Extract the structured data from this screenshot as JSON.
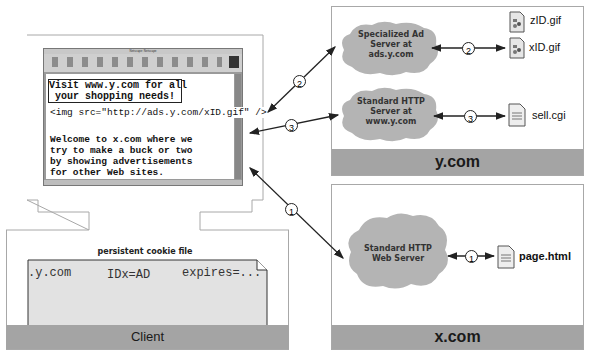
{
  "client": {
    "label": "Client",
    "browser": {
      "title": "Netscape: Netscape",
      "toolbar_buttons": [
        "Back",
        "Forward",
        "Reload",
        "Home",
        "Search",
        "Netscape",
        "Images",
        "Print",
        "Security",
        "Stop"
      ],
      "ad_banner_line1": "Visit www.y.com for all",
      "ad_banner_line2": "your shopping needs!",
      "img_tag": "<img src=\"http://ads.y.com/xID.gif\" />",
      "body_lines": [
        "Welcome to x.com where we",
        "try to make a buck or two",
        "by showing advertisements",
        "for other Web sites."
      ]
    },
    "cookie_file": {
      "title": "persistent cookie file",
      "domain": ".y.com",
      "value": "IDx=AD",
      "expires": "expires=..."
    }
  },
  "ycom": {
    "label": "y.com",
    "ad_server": {
      "line1": "Specialized Ad",
      "line2": "Server at",
      "line3": "ads.y.com"
    },
    "http_server": {
      "line1": "Standard HTTP",
      "line2": "Server at",
      "line3": "www.y.com"
    },
    "files": {
      "zid": "zID.gif",
      "xid": "xID.gif",
      "sell": "sell.cgi"
    }
  },
  "xcom": {
    "label": "x.com",
    "web_server": {
      "line1": "Standard HTTP",
      "line2": "Web Server"
    },
    "files": {
      "page": "page.html"
    }
  },
  "steps": {
    "one": "1",
    "two": "2",
    "three": "3"
  },
  "colors": {
    "band": "#a4a4a4",
    "cloud": "#b4b4b4",
    "cookie_bg": "#e2e2e2",
    "arrow": "#222222"
  }
}
